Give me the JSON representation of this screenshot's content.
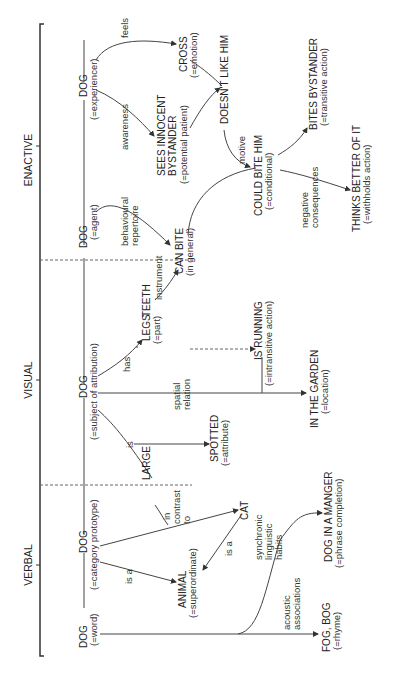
{
  "sections": {
    "verbal": "VERBAL",
    "visual": "VISUAL",
    "enactive": "ENACTIVE"
  },
  "nodes": {
    "dog_word": {
      "label": "DOG",
      "sub": "(=word)"
    },
    "dog_category": {
      "label": "DOG",
      "sub": "(=category prototype)"
    },
    "animal": {
      "label": "ANIMAL",
      "sub": "(=superordinate)"
    },
    "cat": {
      "label": "CAT"
    },
    "fog_bog": {
      "label": "FOG, BOG",
      "sub": "(=rhyme)"
    },
    "dog_manger": {
      "label": "DOG IN A MANGER",
      "sub": "(=phrase completion)"
    },
    "dog_attribution": {
      "label": "DOG",
      "sub": "(=subject of attribution)"
    },
    "large": {
      "label": "LARGE"
    },
    "spotted": {
      "label": "SPOTTED",
      "sub": "(=attribute)"
    },
    "legs": {
      "label": "LEGS",
      "sub": "(=part)"
    },
    "teeth": {
      "label": "TEETH"
    },
    "is_running": {
      "label": "IS RUNNING",
      "sub": "(=intransitive action)"
    },
    "in_garden": {
      "label": "IN THE GARDEN",
      "sub": "(=location)"
    },
    "dog_agent": {
      "label": "DOG",
      "sub": "(=agent)"
    },
    "can_bite": {
      "label": "CAN BITE",
      "sub": "(in general)"
    },
    "dog_experiencer": {
      "label": "DOG",
      "sub": "(=experiencer)"
    },
    "sees_bystander": {
      "label": "SEES INNOCENT",
      "label2": "BYSTANDER",
      "sub": "(=potential patient)"
    },
    "cross": {
      "label": "CROSS",
      "sub": "(=emotion)"
    },
    "doesnt_like": {
      "label": "DOESN'T LIKE HIM"
    },
    "could_bite": {
      "label": "COULD BITE HIM",
      "sub": "(=conditional)"
    },
    "bites_bystander": {
      "label": "BITES BYSTANDER",
      "sub": "(=transitive action)"
    },
    "thinks_better": {
      "label": "THINKS BETTER OF IT",
      "sub": "(=withholds action)"
    }
  },
  "edges": {
    "is_a_1": "is a",
    "is_a_2": "is a",
    "in_contrast_to": [
      "in",
      "contrast",
      "to"
    ],
    "acoustic": [
      "acoustic",
      "associations"
    ],
    "synchronic": [
      "synchronic",
      "linguistic",
      "habits"
    ],
    "is": "is",
    "has": "has",
    "spatial": [
      "spatial",
      "relation"
    ],
    "instrument": "instrument",
    "behavioural": [
      "behavioural",
      "repertoire"
    ],
    "awareness": "awareness",
    "feels": "feels",
    "motive": "motive",
    "negative": [
      "negative",
      "consequences"
    ]
  }
}
